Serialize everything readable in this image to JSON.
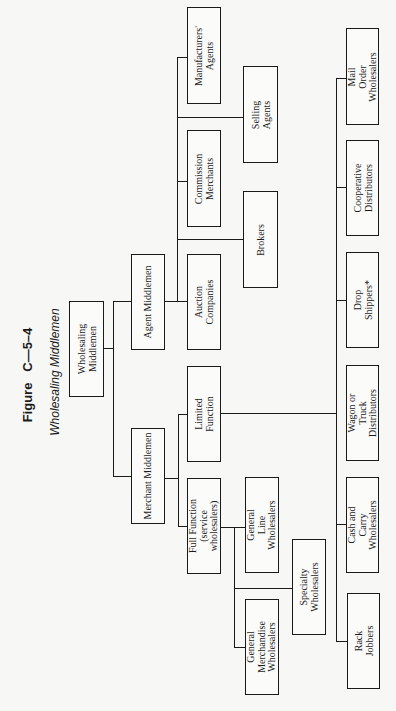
{
  "figure": {
    "number": "Figure   C—5–4",
    "title": "Wholesaling Middlemen"
  },
  "nodes": {
    "root": "Wholesaling\nMiddlemen",
    "agent": "Agent Middlemen",
    "merchant": "Merchant Middlemen",
    "auction": "Auction\nCompanies",
    "brokers": "Brokers",
    "commission": "Commission\nMerchants",
    "selling": "Selling\nAgents",
    "manufacturers": "Manufacturers'\nAgents",
    "limited": "Limited\nFunction",
    "full": "Full Function\n(service\nwholesalers)",
    "general_line": "General\nLine\nWholesalers",
    "specialty": "Specialty\nWholesalers",
    "general_merch": "General\nMerchandise\nWholesalers",
    "mail_order": "Mail\nOrder\nWholesalers",
    "cooperative": "Cooperative\nDistributors",
    "drop": "Drop\nShippers*",
    "wagon": "Wagon or\nTruck\nDistributors",
    "cash_carry": "Cash and\nCarry\nWholesalers",
    "rack": "Rack\nJobbers"
  },
  "hierarchy": {
    "Wholesaling Middlemen": [
      "Agent Middlemen",
      "Merchant Middlemen"
    ],
    "Agent Middlemen": [
      "Auction Companies",
      "Brokers",
      "Commission Merchants",
      "Selling Agents",
      "Manufacturers' Agents"
    ],
    "Merchant Middlemen": [
      "Limited Function",
      "Full Function (service wholesalers)"
    ],
    "Full Function (service wholesalers)": [
      "General Line Wholesalers",
      "Specialty Wholesalers",
      "General Merchandise Wholesalers"
    ],
    "Limited Function": [
      "Mail Order Wholesalers",
      "Cooperative Distributors",
      "Drop Shippers*",
      "Wagon or Truck Distributors",
      "Cash and Carry Wholesalers",
      "Rack Jobbers"
    ]
  }
}
